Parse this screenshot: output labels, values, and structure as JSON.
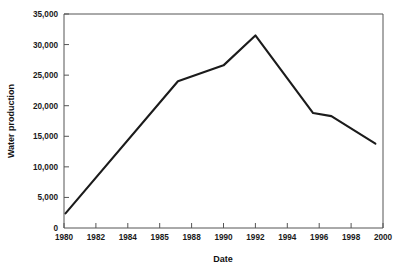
{
  "chart_data": {
    "type": "line",
    "title": "",
    "xlabel": "Date",
    "ylabel": "Water production",
    "xlim": [
      1980,
      2001
    ],
    "ylim": [
      0,
      35000
    ],
    "grid": false,
    "legend": null,
    "x_tick_labels": [
      "1980",
      "1982",
      "1984",
      "1985",
      "1988",
      "1990",
      "1992",
      "1994",
      "1996",
      "1998",
      "2000"
    ],
    "y_tick_labels": [
      "0",
      "5,000",
      "10,000",
      "15,000",
      "20,000",
      "25,000",
      "30,000",
      "35,000"
    ],
    "y_tick_values": [
      0,
      5000,
      10000,
      15000,
      20000,
      25000,
      30000,
      35000
    ],
    "series": [
      {
        "name": "Water production",
        "color": "#1b1b1b",
        "x": [
          1980.1,
          1987.5,
          1990.5,
          1992.6,
          1996.4,
          1997.6,
          2000.5
        ],
        "values": [
          2400,
          24000,
          26600,
          31500,
          18800,
          18300,
          13800
        ]
      }
    ]
  },
  "axis": {
    "x_title": "Date",
    "y_title": "Water production"
  },
  "colors": {
    "line": "#1b1b1b",
    "frame": "#555555",
    "text": "#111111",
    "background": "#ffffff"
  }
}
